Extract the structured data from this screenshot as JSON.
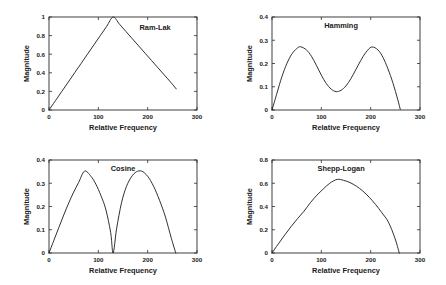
{
  "figure": {
    "background_color": "#ffffff",
    "line_color": "#1a1a1a",
    "axis_color": "#2b2b2b",
    "panel_count": 4
  },
  "chart_data": [
    {
      "type": "line",
      "title": "Ram-Lak",
      "xlabel": "Relative Frequency",
      "ylabel": "Magnitude",
      "xlim": [
        0,
        300
      ],
      "ylim": [
        0,
        1
      ],
      "xticks": [
        0,
        100,
        200,
        300
      ],
      "xticklabels": [
        "0",
        "100",
        "200",
        "300"
      ],
      "yticks": [
        0,
        0.2,
        0.4,
        0.6,
        0.8,
        1
      ],
      "yticklabels": [
        "0",
        "0.2",
        "0.4",
        "0.6",
        "0.8",
        "1"
      ],
      "grid": false,
      "legend": "none",
      "x": [
        0,
        13,
        26,
        39,
        52,
        65,
        78,
        91,
        104,
        117,
        130,
        143,
        156,
        169,
        182,
        195,
        208,
        221,
        234,
        247,
        258
      ],
      "y": [
        0,
        0.1,
        0.2,
        0.3,
        0.4,
        0.5,
        0.6,
        0.7,
        0.8,
        0.9,
        1.0,
        0.9219,
        0.8438,
        0.7656,
        0.6875,
        0.6094,
        0.5313,
        0.4531,
        0.375,
        0.2969,
        0.2266
      ]
    },
    {
      "type": "line",
      "title": "Hamming",
      "xlabel": "Relative Frequency",
      "ylabel": "Magnitude",
      "xlim": [
        0,
        300
      ],
      "ylim": [
        0,
        0.4
      ],
      "xticks": [
        0,
        100,
        200,
        300
      ],
      "xticklabels": [
        "0",
        "100",
        "200",
        "300"
      ],
      "yticks": [
        0,
        0.1,
        0.2,
        0.3,
        0.4
      ],
      "yticklabels": [
        "0",
        "0.1",
        "0.2",
        "0.3",
        "0.4"
      ],
      "grid": false,
      "legend": "none",
      "peak1": {
        "x": 58,
        "y": 0.272
      },
      "peak2": {
        "x": 202,
        "y": 0.271
      },
      "valley": {
        "x": 130,
        "y": 0.079
      },
      "x": [
        0,
        10,
        20,
        30,
        40,
        50,
        58,
        70,
        80,
        90,
        100,
        110,
        120,
        130,
        140,
        150,
        160,
        170,
        180,
        190,
        202,
        215,
        225,
        235,
        245,
        255,
        260
      ],
      "y": [
        0,
        0.072,
        0.143,
        0.199,
        0.24,
        0.264,
        0.272,
        0.258,
        0.231,
        0.192,
        0.15,
        0.114,
        0.09,
        0.079,
        0.085,
        0.104,
        0.135,
        0.174,
        0.213,
        0.247,
        0.271,
        0.258,
        0.226,
        0.177,
        0.117,
        0.044,
        0.003
      ]
    },
    {
      "type": "line",
      "title": "Cosine",
      "xlabel": "Relative Frequency",
      "ylabel": "Magnitude",
      "xlim": [
        0,
        300
      ],
      "ylim": [
        0,
        0.4
      ],
      "xticks": [
        0,
        100,
        200,
        300
      ],
      "xticklabels": [
        "0",
        "100",
        "200",
        "300"
      ],
      "yticks": [
        0,
        0.1,
        0.2,
        0.3,
        0.4
      ],
      "yticklabels": [
        "0",
        "0.1",
        "0.2",
        "0.3",
        "0.4"
      ],
      "grid": false,
      "legend": "none",
      "peak1": {
        "x": 72,
        "y": 0.352
      },
      "peak2": {
        "x": 188,
        "y": 0.352
      },
      "zero_crossing": {
        "x": 130,
        "y": 0
      },
      "x": [
        0,
        10,
        20,
        30,
        40,
        50,
        60,
        72,
        85,
        95,
        105,
        115,
        125,
        130,
        137,
        147,
        157,
        167,
        177,
        188,
        200,
        212,
        224,
        236,
        248,
        257
      ],
      "y": [
        0,
        0.055,
        0.11,
        0.164,
        0.215,
        0.262,
        0.303,
        0.352,
        0.33,
        0.296,
        0.248,
        0.189,
        0.088,
        0.0,
        0.104,
        0.216,
        0.286,
        0.327,
        0.349,
        0.352,
        0.33,
        0.287,
        0.227,
        0.155,
        0.063,
        0.0
      ]
    },
    {
      "type": "line",
      "title": "Shepp-Logan",
      "xlabel": "Relative Frequency",
      "ylabel": "Magnitude",
      "xlim": [
        0,
        300
      ],
      "ylim": [
        0,
        0.8
      ],
      "xticks": [
        0,
        100,
        200,
        300
      ],
      "xticklabels": [
        "0",
        "100",
        "200",
        "300"
      ],
      "yticks": [
        0,
        0.2,
        0.4,
        0.6,
        0.8
      ],
      "yticklabels": [
        "0",
        "0.2",
        "0.4",
        "0.6",
        "0.8"
      ],
      "grid": false,
      "legend": "none",
      "peak": {
        "x": 132,
        "y": 0.633
      },
      "x": [
        0,
        13,
        26,
        39,
        52,
        65,
        78,
        91,
        104,
        117,
        132,
        145,
        158,
        171,
        184,
        197,
        210,
        223,
        236,
        249,
        258
      ],
      "y": [
        0,
        0.079,
        0.156,
        0.229,
        0.297,
        0.36,
        0.434,
        0.497,
        0.551,
        0.6,
        0.633,
        0.625,
        0.606,
        0.575,
        0.533,
        0.48,
        0.417,
        0.345,
        0.265,
        0.13,
        0.0
      ]
    }
  ]
}
